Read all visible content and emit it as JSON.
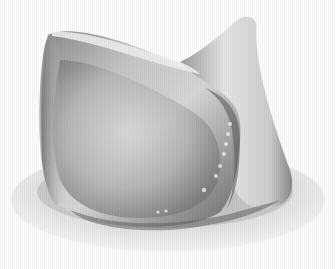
{
  "image": {
    "subject": "3D rendered grayscale anatomical valve-like mesh model",
    "background_color": "#ffffff",
    "palette": {
      "highlight": "#f2f2f2",
      "light": "#d6d6d6",
      "mid": "#a8a8a8",
      "dark": "#6a6a6a",
      "shadow": "#4a4a4a",
      "base_ring": "#e4e4e4"
    }
  }
}
